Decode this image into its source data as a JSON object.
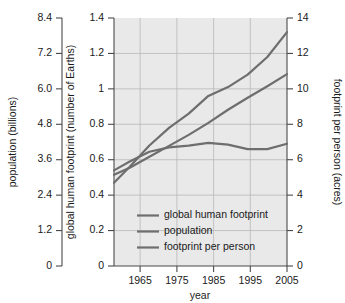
{
  "chart_data": {
    "type": "line",
    "title": "",
    "xlabel": "year",
    "x": [
      1961,
      1965,
      1970,
      1975,
      1980,
      1985,
      1990,
      1995,
      2000,
      2005
    ],
    "xlim": [
      1961,
      2005
    ],
    "x_ticks": [
      1965,
      1975,
      1985,
      1995,
      2005
    ],
    "x_tick_labels": [
      "1965",
      "1975",
      "1985",
      "1995",
      "2005"
    ],
    "grid": true,
    "legend_position": "bottom-left-inside",
    "axes": [
      {
        "id": "left",
        "label": "population (billions)",
        "lim": [
          0,
          8.4
        ],
        "ticks": [
          0,
          1.2,
          2.4,
          3.6,
          4.8,
          6.0,
          7.2,
          8.4
        ],
        "tick_labels": [
          "0",
          "1.2",
          "2.4",
          "3.6",
          "4.8",
          "6.0",
          "7.2",
          "8.4"
        ]
      },
      {
        "id": "middle",
        "label": "global human footprint (number of Earths)",
        "lim": [
          0,
          1.4
        ],
        "ticks": [
          0,
          0.2,
          0.4,
          0.6,
          0.8,
          1,
          1.2,
          1.4
        ],
        "tick_labels": [
          "0",
          "0.2",
          "0.4",
          "0.6",
          "0.8",
          "1",
          "1.2",
          "1.4"
        ]
      },
      {
        "id": "right",
        "label": "footprint per person (acres)",
        "lim": [
          0,
          14
        ],
        "ticks": [
          0,
          2,
          4,
          6,
          8,
          10,
          12,
          14
        ],
        "tick_labels": [
          "0",
          "2",
          "4",
          "6",
          "8",
          "10",
          "12",
          "14"
        ]
      }
    ],
    "series": [
      {
        "name": "global human footprint",
        "axis": "middle",
        "unit": "number of Earths",
        "values": [
          0.47,
          0.56,
          0.68,
          0.78,
          0.86,
          0.96,
          1.01,
          1.08,
          1.18,
          1.32
        ]
      },
      {
        "name": "population",
        "axis": "left",
        "unit": "billions",
        "values": [
          3.09,
          3.33,
          3.7,
          4.07,
          4.44,
          4.85,
          5.29,
          5.7,
          6.09,
          6.5
        ],
        "values_middle_scale": [
          0.515,
          0.555,
          0.617,
          0.678,
          0.74,
          0.808,
          0.882,
          0.95,
          1.015,
          1.083
        ]
      },
      {
        "name": "footprint per person",
        "axis": "right",
        "unit": "acres",
        "values": [
          5.4,
          5.9,
          6.45,
          6.7,
          6.8,
          6.95,
          6.85,
          6.6,
          6.6,
          6.9
        ],
        "values_middle_scale": [
          0.54,
          0.59,
          0.645,
          0.67,
          0.68,
          0.695,
          0.685,
          0.66,
          0.66,
          0.69
        ]
      }
    ],
    "legend": [
      "global human footprint",
      "population",
      "footprint per person"
    ],
    "colors": {
      "line": "#6e6e6e",
      "plot_background": "#e9e9e9",
      "gridline": "#b8b8b8",
      "axis": "#4a4a4a",
      "text": "#1a1a1a",
      "page_background": "#ffffff"
    }
  }
}
